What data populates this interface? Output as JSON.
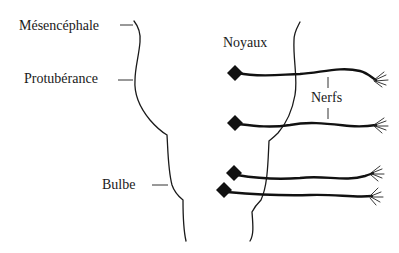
{
  "diagram": {
    "regions": [
      {
        "id": "mesencephale",
        "label": "Mésencéphale"
      },
      {
        "id": "protuberance",
        "label": "Protubérance"
      },
      {
        "id": "bulbe",
        "label": "Bulbe"
      }
    ],
    "annotations": {
      "noyaux": "Noyaux",
      "nerfs": "Nerfs"
    },
    "nerves": [
      {
        "id": "nerve-1",
        "nucleus": "diamond"
      },
      {
        "id": "nerve-2",
        "nucleus": "diamond"
      },
      {
        "id": "nerve-3",
        "nucleus": "diamond"
      },
      {
        "id": "nerve-4",
        "nucleus": "diamond"
      }
    ],
    "colors": {
      "line": "#1a1a1a",
      "background": "#ffffff"
    }
  }
}
